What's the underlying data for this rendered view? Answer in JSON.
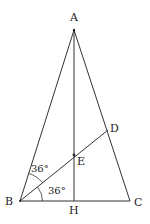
{
  "diagram": {
    "type": "geometry-triangle",
    "stroke_color": "#333333",
    "points": {
      "A": {
        "label": "A",
        "x": 74,
        "y": 30
      },
      "B": {
        "label": "B",
        "x": 20,
        "y": 201
      },
      "C": {
        "label": "C",
        "x": 130,
        "y": 201
      },
      "H": {
        "label": "H",
        "x": 74,
        "y": 201
      },
      "E": {
        "label": "E",
        "x": 74,
        "y": 155
      },
      "D": {
        "label": "D",
        "x": 108,
        "y": 130
      }
    },
    "segments": [
      "AB",
      "AC",
      "BC",
      "AH",
      "BD"
    ],
    "angles": [
      {
        "label": "36°",
        "vertex": "B",
        "between": [
          "BA",
          "BD"
        ]
      },
      {
        "label": "36°",
        "vertex": "B",
        "between": [
          "BD",
          "BC"
        ]
      }
    ]
  }
}
